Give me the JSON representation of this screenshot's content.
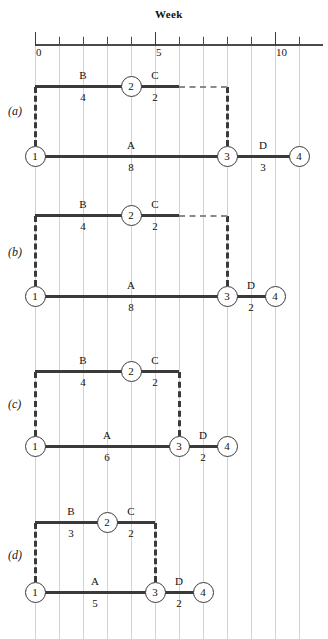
{
  "figure": {
    "axis_title": "Week",
    "axis_ticks": [
      "0",
      "1",
      "2",
      "3",
      "4",
      "5",
      "6",
      "7",
      "8",
      "9",
      "10",
      "11"
    ],
    "axis_labeled_ticks": [
      {
        "value": 0,
        "label": "0"
      },
      {
        "value": 5,
        "label": "5"
      },
      {
        "value": 10,
        "label": "10"
      }
    ],
    "axis_min": 0,
    "axis_max": 12,
    "units_per_week_px": 24,
    "origin_px": 35
  },
  "chart_data": {
    "type": "gantt",
    "title": "Week",
    "xlabel": "Week",
    "xlim": [
      0,
      12
    ],
    "grid": true,
    "panels": [
      {
        "id": "a",
        "label": "(a)",
        "tasks": [
          {
            "name": "B",
            "duration": "4",
            "start": 0,
            "end": 4,
            "row": "top",
            "style": "solid"
          },
          {
            "name": "C",
            "duration": "2",
            "start": 4,
            "end": 6,
            "row": "top",
            "style": "solid"
          },
          {
            "name": "A",
            "duration": "8",
            "start": 0,
            "end": 8,
            "row": "bottom",
            "style": "solid"
          },
          {
            "name": "D",
            "duration": "3",
            "start": 8,
            "end": 11,
            "row": "bottom",
            "style": "solid"
          }
        ],
        "float_link": {
          "from": 6,
          "to": 8,
          "row": "top",
          "style": "dashed"
        },
        "nodes": [
          {
            "id": "1",
            "week": 0,
            "row": "bottom"
          },
          {
            "id": "2",
            "week": 4,
            "row": "top"
          },
          {
            "id": "3",
            "week": 8,
            "row": "bottom"
          },
          {
            "id": "4",
            "week": 11,
            "row": "bottom"
          }
        ],
        "dummy_links": [
          {
            "week": 0,
            "style": "dashed"
          },
          {
            "week": 8,
            "style": "dashed"
          }
        ]
      },
      {
        "id": "b",
        "label": "(b)",
        "tasks": [
          {
            "name": "B",
            "duration": "4",
            "start": 0,
            "end": 4,
            "row": "top",
            "style": "solid"
          },
          {
            "name": "C",
            "duration": "2",
            "start": 4,
            "end": 6,
            "row": "top",
            "style": "solid"
          },
          {
            "name": "A",
            "duration": "8",
            "start": 0,
            "end": 8,
            "row": "bottom",
            "style": "solid"
          },
          {
            "name": "D",
            "duration": "2",
            "start": 8,
            "end": 10,
            "row": "bottom",
            "style": "solid"
          }
        ],
        "float_link": {
          "from": 6,
          "to": 8,
          "row": "top",
          "style": "dashed"
        },
        "nodes": [
          {
            "id": "1",
            "week": 0,
            "row": "bottom"
          },
          {
            "id": "2",
            "week": 4,
            "row": "top"
          },
          {
            "id": "3",
            "week": 8,
            "row": "bottom"
          },
          {
            "id": "4",
            "week": 10,
            "row": "bottom"
          }
        ],
        "dummy_links": [
          {
            "week": 0,
            "style": "dashed"
          },
          {
            "week": 8,
            "style": "dashed"
          }
        ]
      },
      {
        "id": "c",
        "label": "(c)",
        "tasks": [
          {
            "name": "B",
            "duration": "4",
            "start": 0,
            "end": 4,
            "row": "top",
            "style": "solid"
          },
          {
            "name": "C",
            "duration": "2",
            "start": 4,
            "end": 6,
            "row": "top",
            "style": "solid"
          },
          {
            "name": "A",
            "duration": "6",
            "start": 0,
            "end": 6,
            "row": "bottom",
            "style": "solid"
          },
          {
            "name": "D",
            "duration": "2",
            "start": 6,
            "end": 8,
            "row": "bottom",
            "style": "solid"
          }
        ],
        "float_link": null,
        "nodes": [
          {
            "id": "1",
            "week": 0,
            "row": "bottom"
          },
          {
            "id": "2",
            "week": 4,
            "row": "top"
          },
          {
            "id": "3",
            "week": 6,
            "row": "bottom"
          },
          {
            "id": "4",
            "week": 8,
            "row": "bottom"
          }
        ],
        "dummy_links": [
          {
            "week": 0,
            "style": "dashed"
          },
          {
            "week": 6,
            "style": "dashed"
          }
        ]
      },
      {
        "id": "d",
        "label": "(d)",
        "tasks": [
          {
            "name": "B",
            "duration": "3",
            "start": 0,
            "end": 3,
            "row": "top",
            "style": "solid"
          },
          {
            "name": "C",
            "duration": "2",
            "start": 3,
            "end": 5,
            "row": "top",
            "style": "solid"
          },
          {
            "name": "A",
            "duration": "5",
            "start": 0,
            "end": 5,
            "row": "bottom",
            "style": "solid"
          },
          {
            "name": "D",
            "duration": "2",
            "start": 5,
            "end": 7,
            "row": "bottom",
            "style": "solid"
          }
        ],
        "float_link": null,
        "nodes": [
          {
            "id": "1",
            "week": 0,
            "row": "bottom"
          },
          {
            "id": "2",
            "week": 3,
            "row": "top"
          },
          {
            "id": "3",
            "week": 5,
            "row": "bottom"
          },
          {
            "id": "4",
            "week": 7,
            "row": "bottom"
          }
        ],
        "dummy_links": [
          {
            "week": 0,
            "style": "dashed"
          },
          {
            "week": 5,
            "style": "dashed"
          }
        ]
      }
    ]
  },
  "colors": {
    "ink": "#3a3a3a",
    "grid": "#d2d2d2",
    "paper": "#ffffff"
  }
}
